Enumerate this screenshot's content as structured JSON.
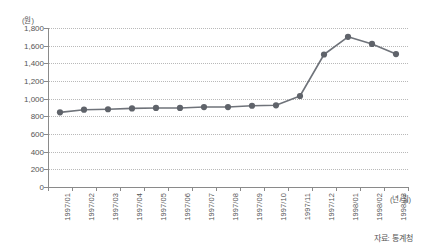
{
  "chart_data": {
    "type": "line",
    "title": "",
    "subtitle": "",
    "xlabel": "(년/월)",
    "ylabel": "(원)",
    "ylim": [
      0,
      1800
    ],
    "ytick_step": 200,
    "grid": true,
    "legend": false,
    "legend_position": "none",
    "source_note": "자료: 통계청",
    "series_color": "#6f737a",
    "marker_color": "#5f636a",
    "categories": [
      "1997/01",
      "1997/02",
      "1997/03",
      "1997/04",
      "1997/05",
      "1997/06",
      "1997/07",
      "1997/08",
      "1997/09",
      "1997/10",
      "1997/11",
      "1997/12",
      "1998/01",
      "1998/02",
      "1998/03"
    ],
    "values": [
      845,
      875,
      880,
      890,
      895,
      895,
      905,
      905,
      920,
      925,
      1030,
      1500,
      1700,
      1620,
      1505
    ],
    "ytick_labels": [
      "0",
      "200",
      "400",
      "600",
      "800",
      "1,000",
      "1,200",
      "1,400",
      "1,600",
      "1,800"
    ],
    "ytick_values": [
      0,
      200,
      400,
      600,
      800,
      1000,
      1200,
      1400,
      1600,
      1800
    ]
  }
}
